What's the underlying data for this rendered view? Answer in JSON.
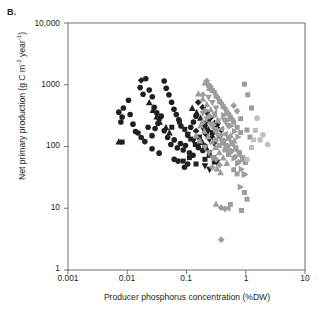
{
  "panel": {
    "label": "B."
  },
  "axes": {
    "xlabel": "Producer phosphorus concentration (%DW)",
    "ylabel_main": "Net primary production (g C m",
    "ylabel_sup1": "-2",
    "ylabel_mid": " year",
    "ylabel_sup2": "-1",
    "ylabel_end": ")",
    "xticks": [
      "0.001",
      "0.01",
      "0.1",
      "1",
      "10"
    ],
    "yticks": [
      "1",
      "10",
      "100",
      "1000",
      "10,000"
    ]
  },
  "colors": {
    "dark": "#231f20",
    "gray": "#9d9d9d",
    "light_gray": "#bfbfbf",
    "frame": "#6e6e6e",
    "background": "#ffffff"
  },
  "chart_data": {
    "type": "scatter",
    "title": "",
    "xlabel": "Producer phosphorus concentration (%DW)",
    "ylabel": "Net primary production (g C m-2 year-1)",
    "xscale": "log",
    "yscale": "log",
    "xlim": [
      0.001,
      10
    ],
    "ylim": [
      1,
      10000
    ],
    "grid": false,
    "legend": "none",
    "series": [
      {
        "name": "dark-circle",
        "color": "#231f20",
        "marker": "circle",
        "points": [
          [
            0.0072,
            360
          ],
          [
            0.0082,
            300
          ],
          [
            0.0086,
            420
          ],
          [
            0.0078,
            250
          ],
          [
            0.0105,
            560
          ],
          [
            0.0112,
            330
          ],
          [
            0.0125,
            230
          ],
          [
            0.0138,
            175
          ],
          [
            0.0165,
            900
          ],
          [
            0.0185,
            700
          ],
          [
            0.0205,
            1250
          ],
          [
            0.0235,
            820
          ],
          [
            0.0265,
            640
          ],
          [
            0.0285,
            430
          ],
          [
            0.0315,
            350
          ],
          [
            0.0345,
            280
          ],
          [
            0.0152,
            165
          ],
          [
            0.0172,
            140
          ],
          [
            0.0198,
            120
          ],
          [
            0.0225,
            205
          ],
          [
            0.0262,
            150
          ],
          [
            0.0295,
            195
          ],
          [
            0.033,
            235
          ],
          [
            0.0375,
            310
          ],
          [
            0.042,
            1150
          ],
          [
            0.0455,
            880
          ],
          [
            0.0505,
            690
          ],
          [
            0.056,
            520
          ],
          [
            0.0615,
            400
          ],
          [
            0.0672,
            330
          ],
          [
            0.074,
            270
          ],
          [
            0.0805,
            215
          ],
          [
            0.042,
            180
          ],
          [
            0.048,
            140
          ],
          [
            0.0545,
            108
          ],
          [
            0.062,
            128
          ],
          [
            0.07,
            95
          ],
          [
            0.079,
            112
          ],
          [
            0.088,
            88
          ],
          [
            0.096,
            104
          ],
          [
            0.105,
            152
          ],
          [
            0.118,
            205
          ],
          [
            0.131,
            250
          ],
          [
            0.145,
            310
          ],
          [
            0.158,
            96
          ],
          [
            0.172,
            118
          ],
          [
            0.188,
            86
          ],
          [
            0.205,
            102
          ],
          [
            0.112,
            79
          ],
          [
            0.129,
            72
          ],
          [
            0.0345,
            78
          ],
          [
            0.0262,
            92
          ],
          [
            0.062,
            62
          ],
          [
            0.072,
            58
          ],
          [
            0.0925,
            46
          ],
          [
            0.105,
            52
          ]
        ]
      },
      {
        "name": "dark-square",
        "color": "#231f20",
        "marker": "square",
        "points": [
          [
            0.0082,
            118
          ],
          [
            0.0565,
            205
          ],
          [
            0.076,
            250
          ],
          [
            0.0935,
            190
          ],
          [
            0.118,
            132
          ],
          [
            0.141,
            108
          ],
          [
            0.165,
            142
          ],
          [
            0.088,
            58
          ],
          [
            0.112,
            66
          ],
          [
            0.145,
            52
          ],
          [
            0.205,
            198
          ],
          [
            0.235,
            258
          ],
          [
            0.272,
            168
          ],
          [
            0.315,
            212
          ],
          [
            0.362,
            148
          ],
          [
            0.415,
            118
          ],
          [
            0.205,
            62
          ],
          [
            0.242,
            72
          ],
          [
            0.295,
            56
          ]
        ]
      },
      {
        "name": "dark-triangle-up",
        "color": "#231f20",
        "marker": "triangle-up",
        "points": [
          [
            0.0072,
            120
          ],
          [
            0.0235,
            520
          ],
          [
            0.0272,
            390
          ],
          [
            0.0315,
            305
          ],
          [
            0.0352,
            250
          ],
          [
            0.045,
            205
          ],
          [
            0.0515,
            168
          ],
          [
            0.125,
            420
          ],
          [
            0.148,
            355
          ],
          [
            0.172,
            290
          ],
          [
            0.205,
            238
          ],
          [
            0.235,
            190
          ],
          [
            0.272,
            152
          ],
          [
            0.185,
            118
          ],
          [
            0.215,
            96
          ]
        ]
      },
      {
        "name": "dark-triangle-down",
        "color": "#231f20",
        "marker": "triangle-down",
        "points": [
          [
            0.105,
            155
          ],
          [
            0.131,
            122
          ],
          [
            0.158,
            102
          ],
          [
            0.188,
            196
          ],
          [
            0.22,
            162
          ],
          [
            0.255,
            132
          ],
          [
            0.295,
            108
          ],
          [
            0.335,
            215
          ],
          [
            0.385,
            176
          ],
          [
            0.242,
            78
          ],
          [
            0.282,
            64
          ],
          [
            0.325,
            55
          ],
          [
            0.205,
            48
          ],
          [
            0.245,
            42
          ]
        ]
      },
      {
        "name": "dark-diamond",
        "color": "#231f20",
        "marker": "diamond",
        "points": [
          [
            0.0172,
            1180
          ],
          [
            0.158,
            520
          ],
          [
            0.188,
            430
          ],
          [
            0.22,
            355
          ],
          [
            0.255,
            292
          ],
          [
            0.295,
            238
          ],
          [
            0.335,
            195
          ],
          [
            0.215,
            158
          ],
          [
            0.252,
            128
          ],
          [
            0.145,
            178
          ]
        ]
      },
      {
        "name": "gray-square",
        "color": "#9d9d9d",
        "marker": "square",
        "points": [
          [
            0.235,
            980
          ],
          [
            0.272,
            810
          ],
          [
            0.315,
            660
          ],
          [
            0.362,
            540
          ],
          [
            0.415,
            445
          ],
          [
            0.475,
            365
          ],
          [
            0.545,
            300
          ],
          [
            0.625,
            248
          ],
          [
            0.715,
            205
          ],
          [
            0.82,
            168
          ],
          [
            0.51,
            140
          ],
          [
            0.585,
            115
          ],
          [
            0.675,
            96
          ],
          [
            0.775,
            80
          ],
          [
            0.885,
            66
          ],
          [
            0.985,
            55
          ],
          [
            0.95,
            1020
          ],
          [
            1.08,
            690
          ],
          [
            1.25,
            420
          ],
          [
            0.625,
            42
          ],
          [
            0.715,
            36
          ],
          [
            1.05,
            185
          ],
          [
            1.18,
            142
          ],
          [
            0.445,
            88
          ],
          [
            0.51,
            74
          ],
          [
            0.82,
            282
          ],
          [
            0.315,
            128
          ],
          [
            0.362,
            104
          ],
          [
            0.55,
            11.5
          ],
          [
            0.95,
            18
          ],
          [
            1.05,
            14
          ],
          [
            0.85,
            9.2
          ]
        ]
      },
      {
        "name": "gray-diamond",
        "color": "#9d9d9d",
        "marker": "diamond",
        "points": [
          [
            0.22,
            1150
          ],
          [
            0.255,
            930
          ],
          [
            0.295,
            760
          ],
          [
            0.335,
            620
          ],
          [
            0.385,
            508
          ],
          [
            0.445,
            415
          ],
          [
            0.51,
            340
          ],
          [
            0.585,
            278
          ],
          [
            0.282,
            225
          ],
          [
            0.325,
            185
          ],
          [
            0.375,
            152
          ],
          [
            0.43,
            124
          ],
          [
            0.495,
            102
          ],
          [
            0.57,
            84
          ],
          [
            0.655,
            68
          ],
          [
            0.75,
            56
          ],
          [
            0.205,
            380
          ],
          [
            0.242,
            310
          ],
          [
            0.188,
            245
          ],
          [
            0.625,
            460
          ],
          [
            0.715,
            375
          ],
          [
            0.315,
            62
          ],
          [
            0.362,
            50
          ],
          [
            0.272,
            46
          ],
          [
            0.385,
            10.2
          ],
          [
            0.445,
            9.8
          ],
          [
            0.385,
            3.1
          ],
          [
            0.188,
            690
          ]
        ]
      },
      {
        "name": "gray-triangle-up",
        "color": "#9d9d9d",
        "marker": "triangle-up",
        "points": [
          [
            0.205,
            1080
          ],
          [
            0.242,
            880
          ],
          [
            0.158,
            720
          ],
          [
            0.188,
            590
          ],
          [
            0.22,
            485
          ],
          [
            0.255,
            398
          ],
          [
            0.295,
            325
          ],
          [
            0.335,
            266
          ],
          [
            0.172,
            218
          ],
          [
            0.2,
            178
          ],
          [
            0.232,
            146
          ],
          [
            0.268,
            120
          ],
          [
            0.31,
            98
          ],
          [
            0.358,
            80
          ],
          [
            0.415,
            66
          ],
          [
            0.48,
            54
          ],
          [
            0.145,
            152
          ],
          [
            0.168,
            125
          ],
          [
            0.555,
            152
          ],
          [
            0.64,
            124
          ],
          [
            0.325,
            44
          ],
          [
            0.375,
            38
          ],
          [
            0.315,
            11.8
          ]
        ]
      },
      {
        "name": "gray-triangle-down",
        "color": "#9d9d9d",
        "marker": "triangle-down",
        "points": [
          [
            0.235,
            620
          ],
          [
            0.272,
            508
          ],
          [
            0.315,
            415
          ],
          [
            0.188,
            340
          ],
          [
            0.218,
            278
          ],
          [
            0.252,
            228
          ],
          [
            0.29,
            186
          ],
          [
            0.335,
            152
          ],
          [
            0.385,
            124
          ],
          [
            0.445,
            102
          ],
          [
            0.51,
            84
          ],
          [
            0.205,
            96
          ],
          [
            0.238,
            78
          ],
          [
            0.43,
            265
          ],
          [
            0.495,
            216
          ],
          [
            0.275,
            64
          ]
        ]
      },
      {
        "name": "gray-triangle-right",
        "color": "#9d9d9d",
        "marker": "triangle-right",
        "points": [
          [
            0.43,
            320
          ],
          [
            0.495,
            262
          ],
          [
            0.57,
            214
          ],
          [
            0.655,
            175
          ],
          [
            0.75,
            143
          ],
          [
            0.415,
            118
          ],
          [
            0.48,
            96
          ],
          [
            0.555,
            79
          ],
          [
            0.64,
            64
          ],
          [
            0.735,
            53
          ],
          [
            0.85,
            43
          ],
          [
            0.98,
            35
          ],
          [
            0.82,
            22
          ],
          [
            0.95,
            36
          ]
        ]
      },
      {
        "name": "gray-triangle-left",
        "color": "#9d9d9d",
        "marker": "triangle-left",
        "points": [
          [
            0.385,
            192
          ],
          [
            0.445,
            158
          ],
          [
            0.51,
            130
          ],
          [
            0.585,
            107
          ],
          [
            0.335,
            258
          ],
          [
            0.295,
            345
          ],
          [
            0.675,
            88
          ],
          [
            0.775,
            72
          ],
          [
            0.495,
            10.0
          ],
          [
            0.885,
            59
          ]
        ]
      },
      {
        "name": "light-gray-circle",
        "color": "#bfbfbf",
        "marker": "circle",
        "points": [
          [
            1.55,
            288
          ],
          [
            1.95,
            155
          ],
          [
            2.35,
            108
          ],
          [
            1.75,
            128
          ]
        ]
      },
      {
        "name": "light-gray-square",
        "color": "#bfbfbf",
        "marker": "square",
        "points": [
          [
            1.45,
            182
          ],
          [
            1.25,
            96
          ],
          [
            1.05,
            62
          ],
          [
            1.35,
            128
          ]
        ]
      }
    ]
  }
}
